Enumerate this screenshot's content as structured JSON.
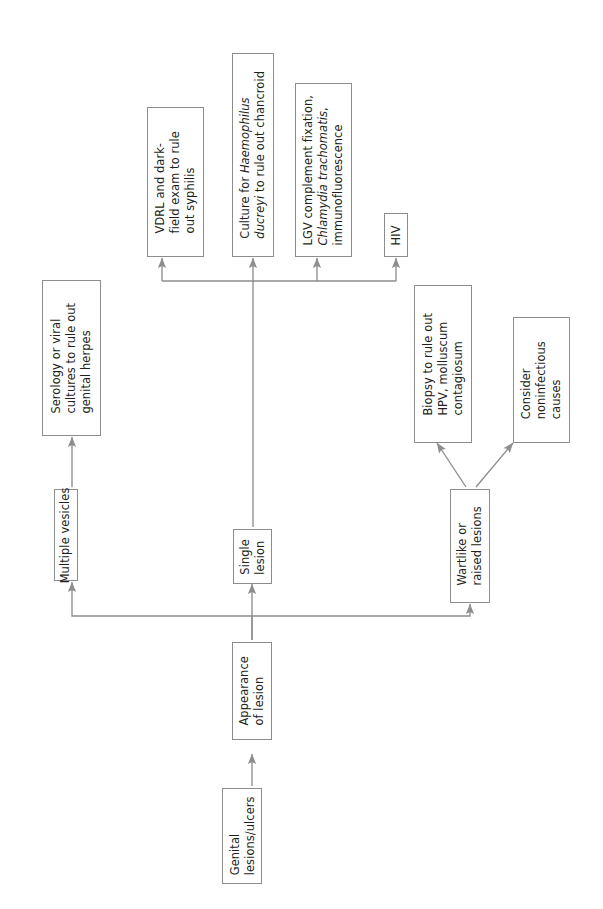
{
  "orientation": "rotated-90-ccw",
  "style": {
    "box_border_color": "#8d8d8d",
    "box_fill_color": "#ffffff",
    "text_color": "#231f20",
    "edge_color": "#8d8d8d",
    "page_background": "#ffffff"
  },
  "nodes": {
    "start": {
      "id": "genital-lesions-ulcers",
      "lines": [
        "Genital",
        "lesions/ulcers"
      ],
      "text": "Genital lesions/ulcers"
    },
    "appearance": {
      "id": "appearance-of-lesion",
      "lines": [
        "Appearance",
        "of lesion"
      ],
      "text": "Appearance of lesion"
    },
    "multiple_vesicles": {
      "id": "multiple-vesicles",
      "lines": [
        "Multiple vesicles"
      ],
      "text": "Multiple vesicles"
    },
    "single_lesion": {
      "id": "single-lesion",
      "lines": [
        "Single",
        "lesion"
      ],
      "text": "Single lesion"
    },
    "wartlike": {
      "id": "wartlike-or-raised-lesions",
      "lines": [
        "Wartlike or",
        "raised lesions"
      ],
      "text": "Wartlike or raised lesions"
    },
    "serology": {
      "id": "serology-or-viral-cultures",
      "lines": [
        "Serology or viral",
        "cultures to rule out",
        "genital herpes"
      ],
      "text": "Serology or viral cultures to rule out genital herpes"
    },
    "vdrl": {
      "id": "vdrl-and-darkfield-exam",
      "lines": [
        "VDRL and dark-",
        "field exam to rule",
        "out syphilis"
      ],
      "text": "VDRL and dark-field exam to rule out syphilis"
    },
    "culture": {
      "id": "culture-for-haemophilus-ducreyi",
      "lines": [
        {
          "segments": [
            {
              "t": "Culture for ",
              "italic": false
            },
            {
              "t": "Haemophilus",
              "italic": true
            }
          ]
        },
        {
          "segments": [
            {
              "t": "ducreyi",
              "italic": true
            },
            {
              "t": " to rule out chancroid",
              "italic": false
            }
          ]
        }
      ],
      "text": "Culture for Haemophilus ducreyi to rule out chancroid"
    },
    "lgv": {
      "id": "lgv-complement-fixation",
      "lines": [
        {
          "segments": [
            {
              "t": "LGV complement fixation,",
              "italic": false
            }
          ]
        },
        {
          "segments": [
            {
              "t": "Chlamydia trachomatis",
              "italic": true
            },
            {
              "t": ",",
              "italic": false
            }
          ]
        },
        {
          "segments": [
            {
              "t": "immunofluorescence",
              "italic": false
            }
          ]
        }
      ],
      "text": "LGV complement fixation, Chlamydia trachomatis, immunofluorescence"
    },
    "hiv": {
      "id": "hiv",
      "lines": [
        "HIV"
      ],
      "text": "HIV"
    },
    "biopsy": {
      "id": "biopsy-to-rule-out-hpv",
      "lines": [
        "Biopsy to rule out",
        "HPV, molluscum",
        "contagiosum"
      ],
      "text": "Biopsy to rule out HPV, molluscum contagiosum"
    },
    "noninfectious": {
      "id": "consider-noninfectious-causes",
      "lines": [
        "Consider",
        "noninfectious",
        "causes"
      ],
      "text": "Consider noninfectious causes"
    }
  },
  "edges": [
    {
      "from": "genital-lesions-ulcers",
      "to": "appearance-of-lesion"
    },
    {
      "from": "appearance-of-lesion",
      "to": "multiple-vesicles"
    },
    {
      "from": "appearance-of-lesion",
      "to": "single-lesion"
    },
    {
      "from": "appearance-of-lesion",
      "to": "wartlike-or-raised-lesions"
    },
    {
      "from": "multiple-vesicles",
      "to": "serology-or-viral-cultures"
    },
    {
      "from": "single-lesion",
      "to": "vdrl-and-darkfield-exam"
    },
    {
      "from": "single-lesion",
      "to": "culture-for-haemophilus-ducreyi"
    },
    {
      "from": "single-lesion",
      "to": "lgv-complement-fixation"
    },
    {
      "from": "single-lesion",
      "to": "hiv"
    },
    {
      "from": "wartlike-or-raised-lesions",
      "to": "biopsy-to-rule-out-hpv"
    },
    {
      "from": "wartlike-or-raised-lesions",
      "to": "consider-noninfectious-causes"
    }
  ]
}
